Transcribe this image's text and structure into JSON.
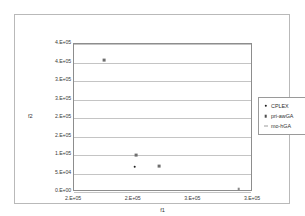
{
  "figure": {
    "scan_caption": "",
    "xaxis_title": "f1",
    "yaxis_title": "f2"
  },
  "legend": {
    "position": "right",
    "items": [
      {
        "label": "CPLEX",
        "marker": "dot"
      },
      {
        "label": "pri-awGA",
        "marker": "square"
      },
      {
        "label": "mo-hGA",
        "marker": "dash"
      }
    ]
  },
  "chart_data": {
    "type": "scatter",
    "title": "",
    "xlabel": "f1",
    "ylabel": "f2",
    "xlim": [
      150000,
      300000
    ],
    "ylim": [
      0,
      400000
    ],
    "grid": true,
    "legend_position": "right",
    "xtick_labels": [
      "2.E+05",
      "2.E+05",
      "3.E+05",
      "3.E+05"
    ],
    "xtick_values": [
      150000,
      200000,
      250000,
      300000
    ],
    "ytick_labels": [
      "4.E+05",
      "4.E+05",
      "3.E+05",
      "3.E+05",
      "2.E+05",
      "2.E+05",
      "1.E+05",
      "5.E+04",
      "0.E+00"
    ],
    "ytick_values": [
      400000,
      350000,
      300000,
      250000,
      200000,
      150000,
      100000,
      50000,
      0
    ],
    "series": [
      {
        "name": "CPLEX",
        "marker": "dot",
        "points": [
          {
            "x": 201000,
            "y": 68000
          }
        ]
      },
      {
        "name": "pri-awGA",
        "marker": "square",
        "points": [
          {
            "x": 175000,
            "y": 357000
          },
          {
            "x": 202000,
            "y": 100000
          },
          {
            "x": 221000,
            "y": 70000
          }
        ]
      },
      {
        "name": "mo-hGA",
        "marker": "dash",
        "points": [
          {
            "x": 288000,
            "y": 8000
          }
        ]
      }
    ]
  }
}
